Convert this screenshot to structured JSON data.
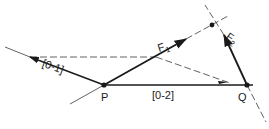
{
  "diagram": {
    "points": {
      "P": {
        "label": "P",
        "x": 104,
        "y": 85
      },
      "Q": {
        "label": "Q",
        "x": 247,
        "y": 85
      },
      "top": {
        "x": 212,
        "y": 25
      }
    },
    "labels": {
      "link_01": "[0-1]",
      "link_02": "[0-2]",
      "force_1": "F",
      "force_1_sub": "1",
      "force_2": "F",
      "force_2_sub": "2"
    },
    "colors": {
      "ink": "#1a1a1a",
      "thin": "#3a3a3a",
      "background": "#ffffff"
    }
  }
}
